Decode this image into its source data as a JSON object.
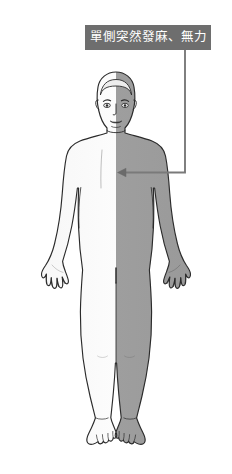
{
  "figure": {
    "type": "medical-illustration",
    "background_color": "#ffffff",
    "description_semantic": "stroke-symptom-diagram-one-sided-numbness-weakness"
  },
  "callout": {
    "label": "單側突然發麻、無力",
    "box_color": "#6e6e6e",
    "text_color": "#ffffff",
    "connector_color": "#7a7a7a",
    "arrow_target": "right-side-torso"
  },
  "body": {
    "outline_color": "#2b2b2b",
    "left_half_fill": "#f2f2f2",
    "right_half_fill": "#9a9a9a",
    "affected_side": "right",
    "unaffected_side": "left"
  }
}
